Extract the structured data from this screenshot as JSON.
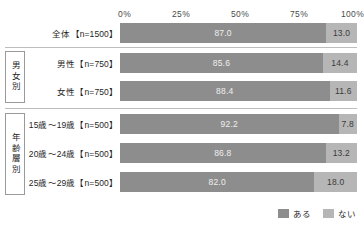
{
  "chart_data": {
    "type": "bar",
    "orientation": "horizontal",
    "stacked": true,
    "stacked_percent": true,
    "title": "",
    "xlabel": "",
    "ylabel": "",
    "xlim": [
      0,
      100
    ],
    "xticks": [
      "0%",
      "25%",
      "50%",
      "75%",
      "100%"
    ],
    "xtick_values": [
      0,
      25,
      50,
      75,
      100
    ],
    "grid": false,
    "legend_position": "bottom-right",
    "legend": [
      "ある",
      "ない"
    ],
    "series": [
      {
        "name": "ある",
        "color": "#8d8d8d",
        "values": [
          87.0,
          85.6,
          88.4,
          92.2,
          86.8,
          82.0
        ]
      },
      {
        "name": "ない",
        "color": "#b6b6b6",
        "values": [
          13.0,
          14.4,
          11.6,
          7.8,
          13.2,
          18.0
        ]
      }
    ],
    "categories": [
      "全体【n=1500】",
      "男性【n=750】",
      "女性【n=750】",
      "15歳～19歳【n=500】",
      "20歳～24歳【n=500】",
      "25歳～29歳【n=500】"
    ],
    "groups": [
      {
        "label": "",
        "rows": [
          0
        ]
      },
      {
        "label": "男女別",
        "rows": [
          1,
          2
        ]
      },
      {
        "label": "年齢層別",
        "rows": [
          3,
          4,
          5
        ]
      }
    ]
  },
  "rows": [
    {
      "label": "全体【n=1500】",
      "a": "87.0",
      "b": "13.0",
      "a_pct": 87.0,
      "b_pct": 13.0
    },
    {
      "label": "男性【n=750】",
      "a": "85.6",
      "b": "14.4",
      "a_pct": 85.6,
      "b_pct": 14.4
    },
    {
      "label": "女性【n=750】",
      "a": "88.4",
      "b": "11.6",
      "a_pct": 88.4,
      "b_pct": 11.6
    },
    {
      "label": "15歳～19歳【n=500】",
      "a": "92.2",
      "b": "7.8",
      "a_pct": 92.2,
      "b_pct": 7.8
    },
    {
      "label": "20歳～24歳【n=500】",
      "a": "86.8",
      "b": "13.2",
      "a_pct": 86.8,
      "b_pct": 13.2
    },
    {
      "label": "25歳～29歳【n=500】",
      "a": "82.0",
      "b": "18.0",
      "a_pct": 82.0,
      "b_pct": 18.0
    }
  ],
  "axis": {
    "ticks": [
      "0%",
      "25%",
      "50%",
      "75%",
      "100%"
    ]
  },
  "groups": {
    "gender": "男女別",
    "age": "年齢層別"
  },
  "legend": {
    "items": [
      {
        "label": "ある",
        "color": "#8d8d8d"
      },
      {
        "label": "ない",
        "color": "#b6b6b6"
      }
    ]
  },
  "colors": {
    "series_a": "#8d8d8d",
    "series_b": "#b6b6b6",
    "rule": "#bdbdbd",
    "box_border": "#9a9a9a",
    "text": "#1f1f1f"
  }
}
